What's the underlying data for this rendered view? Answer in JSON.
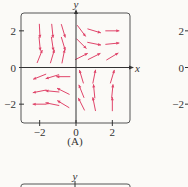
{
  "chart_data": [
    {
      "type": "vector-field",
      "panel_label": "(A)",
      "xlabel": "x",
      "ylabel": "y",
      "xlim": [
        -3,
        3
      ],
      "ylim": [
        -3,
        3
      ],
      "xticks": [
        {
          "v": -2,
          "label": "−2"
        },
        {
          "v": 0,
          "label": "0"
        },
        {
          "v": 2,
          "label": "2"
        }
      ],
      "yticks": [
        {
          "v": 2,
          "label": "2"
        },
        {
          "v": 0,
          "label": "0"
        },
        {
          "v": -2,
          "label": "−2"
        }
      ],
      "grid": false,
      "arrow_color": "#e0456a",
      "vectors": [
        {
          "x": -2,
          "y": 2,
          "dx": 0.05,
          "dy": -1
        },
        {
          "x": -1.3,
          "y": 2,
          "dx": 0.1,
          "dy": -1
        },
        {
          "x": -0.7,
          "y": 2,
          "dx": 0.3,
          "dy": -1
        },
        {
          "x": 0.3,
          "y": 2,
          "dx": 0.6,
          "dy": -0.8
        },
        {
          "x": 1,
          "y": 2,
          "dx": 1,
          "dy": -0.3
        },
        {
          "x": 2,
          "y": 2,
          "dx": 1,
          "dy": 0
        },
        {
          "x": -2,
          "y": 1.3,
          "dx": 0.1,
          "dy": -1
        },
        {
          "x": -1.3,
          "y": 1.3,
          "dx": 0.15,
          "dy": -1
        },
        {
          "x": -0.7,
          "y": 1.3,
          "dx": 0.3,
          "dy": -1
        },
        {
          "x": 0.3,
          "y": 1.3,
          "dx": 0.7,
          "dy": -0.7
        },
        {
          "x": 1,
          "y": 1.3,
          "dx": 1,
          "dy": -0.2
        },
        {
          "x": 2,
          "y": 1.3,
          "dx": 1,
          "dy": 0.1
        },
        {
          "x": -2,
          "y": 0.6,
          "dx": 0.4,
          "dy": 1
        },
        {
          "x": -1.3,
          "y": 0.6,
          "dx": 0.3,
          "dy": 1
        },
        {
          "x": -0.7,
          "y": 0.6,
          "dx": 0.2,
          "dy": 1
        },
        {
          "x": 0.3,
          "y": 0.6,
          "dx": 0.8,
          "dy": 0.4
        },
        {
          "x": 1,
          "y": 0.6,
          "dx": 1,
          "dy": 0.5
        },
        {
          "x": 2,
          "y": 0.6,
          "dx": 1,
          "dy": 0.6
        },
        {
          "x": -2,
          "y": -0.5,
          "dx": -1,
          "dy": -0.4
        },
        {
          "x": -1.3,
          "y": -0.5,
          "dx": -1,
          "dy": -0.3
        },
        {
          "x": -0.7,
          "y": -0.5,
          "dx": -1,
          "dy": 0
        },
        {
          "x": 0.3,
          "y": -0.5,
          "dx": -0.3,
          "dy": 1
        },
        {
          "x": 1,
          "y": -0.5,
          "dx": 0.2,
          "dy": 1
        },
        {
          "x": 2,
          "y": -0.5,
          "dx": 0.3,
          "dy": 1
        },
        {
          "x": -2,
          "y": -1.3,
          "dx": -1,
          "dy": -0.2
        },
        {
          "x": -1.3,
          "y": -1.3,
          "dx": -1,
          "dy": 0.1
        },
        {
          "x": -0.7,
          "y": -1.3,
          "dx": -1,
          "dy": 0.5
        },
        {
          "x": 0.3,
          "y": -1.3,
          "dx": -0.4,
          "dy": 1
        },
        {
          "x": 1,
          "y": -1.3,
          "dx": -0.1,
          "dy": 1
        },
        {
          "x": 2,
          "y": -1.3,
          "dx": 0.1,
          "dy": 1
        },
        {
          "x": -2,
          "y": -2,
          "dx": -1,
          "dy": 0
        },
        {
          "x": -1.3,
          "y": -2,
          "dx": -1,
          "dy": 0.2
        },
        {
          "x": -0.7,
          "y": -2,
          "dx": -1,
          "dy": 0.6
        },
        {
          "x": 0.3,
          "y": -2,
          "dx": -0.5,
          "dy": 1
        },
        {
          "x": 1,
          "y": -2,
          "dx": -0.2,
          "dy": 1
        },
        {
          "x": 2,
          "y": -2,
          "dx": 0,
          "dy": 1
        }
      ]
    },
    {
      "type": "vector-field",
      "partial": "right panel cropped; only y tick labels visible",
      "yticks": [
        {
          "v": 2,
          "label": "2"
        },
        {
          "v": 0,
          "label": "0"
        },
        {
          "v": -2,
          "label": "−2"
        }
      ]
    },
    {
      "type": "vector-field",
      "partial": "bottom panel cropped; only top frame and y label visible",
      "ylabel": "y"
    }
  ]
}
